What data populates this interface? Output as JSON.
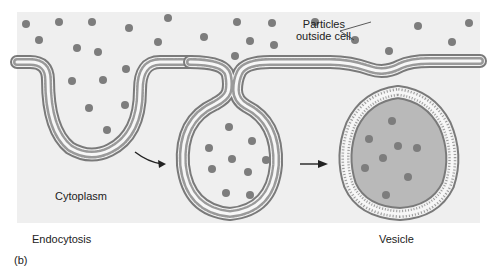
{
  "figure": {
    "panel_label": "(b)",
    "title": "Endocytosis",
    "labels": {
      "particles_line1": "Particles",
      "particles_line2": "outside cell",
      "cytoplasm": "Cytoplasm",
      "process": "Endocytosis",
      "vesicle": "Vesicle"
    },
    "stages": [
      {
        "name": "invagination",
        "description": "Membrane folds inward around particles"
      },
      {
        "name": "pinching",
        "description": "Membrane pocket pinches off"
      },
      {
        "name": "vesicle",
        "description": "Vesicle containing particles inside cell"
      }
    ],
    "colors": {
      "background": "#efefef",
      "membrane": "#8a8a8a",
      "particle": "#7d7d7d",
      "vesicle_fill": "#b9b9b9",
      "text": "#222222"
    }
  }
}
